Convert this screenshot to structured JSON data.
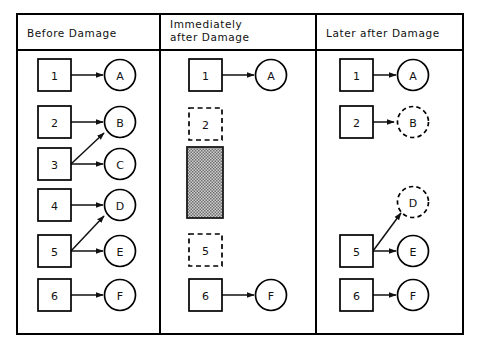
{
  "figure": {
    "background_color": "#ffffff",
    "stroke_color": "#000000",
    "lesion_fill_color": "#9a9a9a",
    "frame": {
      "x": 17,
      "y": 14,
      "width": 446,
      "height": 320
    },
    "header_divider_y": 50,
    "column_dividers_x": [
      160,
      316
    ]
  },
  "panels": [
    {
      "id": "before-damage",
      "title": "Before  Damage",
      "title_lines": [
        "Before  Damage"
      ],
      "sources": [
        {
          "label": "1",
          "state": "intact"
        },
        {
          "label": "2",
          "state": "intact"
        },
        {
          "label": "3",
          "state": "intact"
        },
        {
          "label": "4",
          "state": "intact"
        },
        {
          "label": "5",
          "state": "intact"
        },
        {
          "label": "6",
          "state": "intact"
        }
      ],
      "targets": [
        {
          "label": "A",
          "state": "intact"
        },
        {
          "label": "B",
          "state": "intact"
        },
        {
          "label": "C",
          "state": "intact"
        },
        {
          "label": "D",
          "state": "intact"
        },
        {
          "label": "E",
          "state": "intact"
        },
        {
          "label": "F",
          "state": "intact"
        }
      ],
      "connections": [
        {
          "from": "1",
          "to": "A",
          "kind": "direct"
        },
        {
          "from": "2",
          "to": "B",
          "kind": "direct"
        },
        {
          "from": "3",
          "to": "C",
          "kind": "direct"
        },
        {
          "from": "3",
          "to": "B",
          "kind": "diagonal-up"
        },
        {
          "from": "4",
          "to": "D",
          "kind": "direct"
        },
        {
          "from": "5",
          "to": "E",
          "kind": "direct"
        },
        {
          "from": "5",
          "to": "D",
          "kind": "diagonal-up"
        },
        {
          "from": "6",
          "to": "F",
          "kind": "direct"
        }
      ],
      "lesion": null
    },
    {
      "id": "immediately-after-damage",
      "title": "Immediately after  Damage",
      "title_lines": [
        "Immediately",
        "after  Damage"
      ],
      "sources": [
        {
          "label": "1",
          "state": "intact"
        },
        {
          "label": "2",
          "state": "deafferented"
        },
        {
          "label": "5",
          "state": "deafferented"
        },
        {
          "label": "6",
          "state": "intact"
        }
      ],
      "targets": [
        {
          "label": "A",
          "state": "intact"
        },
        {
          "label": "F",
          "state": "intact"
        }
      ],
      "connections": [
        {
          "from": "1",
          "to": "A",
          "kind": "direct"
        },
        {
          "from": "6",
          "to": "F",
          "kind": "direct"
        }
      ],
      "lesion": {
        "label": "",
        "state": "damaged-region",
        "pattern": "stipple"
      }
    },
    {
      "id": "later-after-damage",
      "title": "Later after  Damage",
      "title_lines": [
        "Later  after  Damage"
      ],
      "sources": [
        {
          "label": "1",
          "state": "intact"
        },
        {
          "label": "2",
          "state": "intact"
        },
        {
          "label": "5",
          "state": "intact"
        },
        {
          "label": "6",
          "state": "intact"
        }
      ],
      "targets": [
        {
          "label": "A",
          "state": "intact"
        },
        {
          "label": "B",
          "state": "reinnervated"
        },
        {
          "label": "D",
          "state": "reinnervated"
        },
        {
          "label": "E",
          "state": "intact"
        },
        {
          "label": "F",
          "state": "intact"
        }
      ],
      "connections": [
        {
          "from": "1",
          "to": "A",
          "kind": "direct"
        },
        {
          "from": "2",
          "to": "B",
          "kind": "direct"
        },
        {
          "from": "5",
          "to": "E",
          "kind": "direct"
        },
        {
          "from": "5",
          "to": "D",
          "kind": "diagonal-up"
        },
        {
          "from": "6",
          "to": "F",
          "kind": "direct"
        }
      ],
      "lesion": null
    }
  ],
  "labels": {
    "p1_title": "Before  Damage",
    "p2_title_l1": "Immediately",
    "p2_title_l2": "after  Damage",
    "p3_title": "Later  after  Damage",
    "n1": "1",
    "n2": "2",
    "n3": "3",
    "n4": "4",
    "n5": "5",
    "n6": "6",
    "nA": "A",
    "nB": "B",
    "nC": "C",
    "nD": "D",
    "nE": "E",
    "nF": "F",
    "m1": "1",
    "m2": "2",
    "m5": "5",
    "m6": "6",
    "mA": "A",
    "mF": "F",
    "r1": "1",
    "r2": "2",
    "r5": "5",
    "r6": "6",
    "rA": "A",
    "rB": "B",
    "rD": "D",
    "rE": "E",
    "rF": "F"
  }
}
